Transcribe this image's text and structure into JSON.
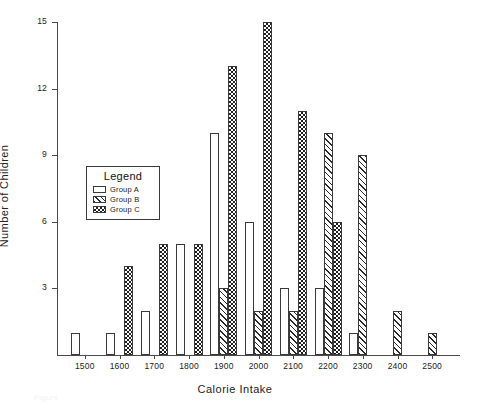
{
  "chart_data": {
    "type": "bar",
    "title": "",
    "xlabel": "Calorie Intake",
    "ylabel": "Number of Children",
    "xlim": [
      1420,
      2580
    ],
    "ylim": [
      0,
      15
    ],
    "yticks": [
      3,
      6,
      9,
      12,
      15
    ],
    "xticks": [
      1500,
      1600,
      1700,
      1800,
      1900,
      2000,
      2100,
      2200,
      2300,
      2400,
      2500
    ],
    "grid": false,
    "legend_position": "inside-upper-left",
    "categories": [
      1500,
      1600,
      1700,
      1800,
      1900,
      2000,
      2100,
      2200,
      2300,
      2400,
      2500
    ],
    "series": [
      {
        "name": "Group A",
        "pattern": "solid-white",
        "values": [
          1,
          1,
          2,
          5,
          10,
          6,
          3,
          3,
          1,
          0,
          0
        ]
      },
      {
        "name": "Group B",
        "pattern": "diagonal-hatch",
        "values": [
          0,
          0,
          0,
          0,
          3,
          2,
          2,
          10,
          9,
          2,
          1
        ]
      },
      {
        "name": "Group C",
        "pattern": "checkerboard",
        "values": [
          0,
          4,
          5,
          5,
          13,
          15,
          11,
          6,
          0,
          0,
          0
        ]
      }
    ]
  },
  "legend": {
    "title": "Legend",
    "entries": [
      {
        "label": "Group A"
      },
      {
        "label": "Group B"
      },
      {
        "label": "Group C"
      }
    ]
  },
  "axes": {
    "y_tick_labels": [
      "15",
      "12",
      "9",
      "6",
      "3"
    ],
    "x_tick_labels": [
      "1500",
      "1600",
      "1700",
      "1800",
      "1900",
      "2000",
      "2100",
      "2200",
      "2300",
      "2400",
      "2500"
    ],
    "y_axis_title": "Number of Children",
    "x_axis_title": "Calorie Intake"
  },
  "caption": {
    "text": "Figure"
  },
  "colors": {
    "ink": "#1e1e1e",
    "axis": "#4a4a4a",
    "background": "#ffffff"
  }
}
